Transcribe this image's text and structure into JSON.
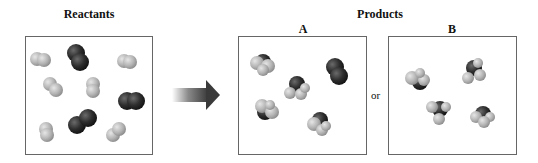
{
  "labels": {
    "reactants": "Reactants",
    "products": "Products",
    "option_a": "A",
    "option_b": "B",
    "or": "or"
  },
  "colors": {
    "light_atom": "#b9b9b9",
    "dark_atom": "#2b2b2b",
    "border": "#666666",
    "arrow": "#3a3a3a"
  },
  "panels": {
    "reactants": {
      "molecules": "6 light diatomic (H2) + 3 dark diatomic (N2)"
    },
    "product_a": {
      "molecules": "4 NH3-like + 1 dark diatomic (N2)"
    },
    "product_b": {
      "molecules": "4 NH3-like"
    }
  }
}
